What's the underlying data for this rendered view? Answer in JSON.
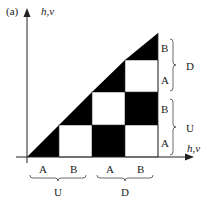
{
  "panel_label": "(a)",
  "y_axis_label": "h,v",
  "x_axis_label": "h,v",
  "x_cell_labels": [
    "A",
    "B",
    "A",
    "B"
  ],
  "y_cell_labels": [
    "A",
    "B",
    "A",
    "B"
  ],
  "x_group_labels": [
    "U",
    "D"
  ],
  "y_group_labels": [
    "U",
    "D"
  ],
  "colors": {
    "fill": "#000000",
    "empty": "#ffffff",
    "line": "#333333"
  },
  "grid": {
    "size": 4,
    "description": "Lower-right triangular checkerboard; diagonal cells are black half-triangles",
    "cells": [
      [
        "diag",
        "white",
        "black",
        "white"
      ],
      [
        null,
        "diag",
        "white",
        "black"
      ],
      [
        null,
        null,
        "diag",
        "white"
      ],
      [
        null,
        null,
        null,
        "diag"
      ]
    ]
  }
}
